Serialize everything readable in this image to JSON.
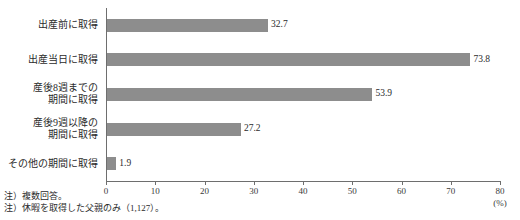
{
  "chart_data": {
    "type": "bar",
    "orientation": "horizontal",
    "title": "",
    "xlabel": "(%)",
    "ylabel": "",
    "xlim": [
      0,
      80
    ],
    "xticks": [
      0,
      10,
      20,
      30,
      40,
      50,
      60,
      70,
      80
    ],
    "grid": false,
    "legend": null,
    "bar_color": "#8d8d8d",
    "axis_color": "#6e6e6e",
    "categories": [
      "出産前に取得",
      "出産当日に取得",
      "産後8週までの\n期間に取得",
      "産後9週以降の\n期間に取得",
      "その他の期間に取得"
    ],
    "values": [
      32.7,
      73.8,
      53.9,
      27.2,
      1.9
    ],
    "value_labels": [
      "32.7",
      "73.8",
      "53.9",
      "27.2",
      "1.9"
    ]
  },
  "axis": {
    "unit_label": "(%)",
    "tick_labels": [
      "0",
      "10",
      "20",
      "30",
      "40",
      "50",
      "60",
      "70",
      "80"
    ]
  },
  "notes": [
    "注）複数回答。",
    "注）休暇を取得した父親のみ（1,127）。"
  ]
}
